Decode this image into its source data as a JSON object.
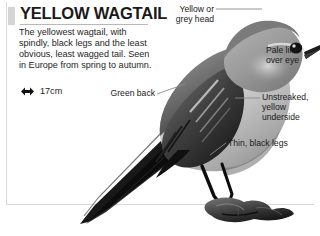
{
  "page": {
    "title": "YELLOW WAGTAIL",
    "description": "The yellowest wagtail, with spindly, black legs and the least obvious, least wagged tail. Seen in Europe from spring to autumn.",
    "size": {
      "icon": "double-headed-arrow-icon",
      "value": "17cm"
    },
    "illustration": {
      "subject": "yellow-wagtail-bird",
      "description": "Grayscale illustration of a yellow wagtail perched on a rock, facing right, with a long tail extending down to the lower left"
    },
    "callouts": [
      {
        "id": "head",
        "text": "Yellow or\ngrey head"
      },
      {
        "id": "pale-line",
        "text": "Pale line\nover eye"
      },
      {
        "id": "green-back",
        "text": "Green back"
      },
      {
        "id": "underside",
        "text": "Unstreaked,\nyellow\nunderside"
      },
      {
        "id": "legs",
        "text": "Thin, black legs"
      }
    ]
  },
  "colors": {
    "text": "#1a1a1a",
    "body_text": "#262626",
    "rule": "#d9d9d9",
    "title_marker": "#d5d5d5",
    "leader_line": "#8a8a8a"
  }
}
